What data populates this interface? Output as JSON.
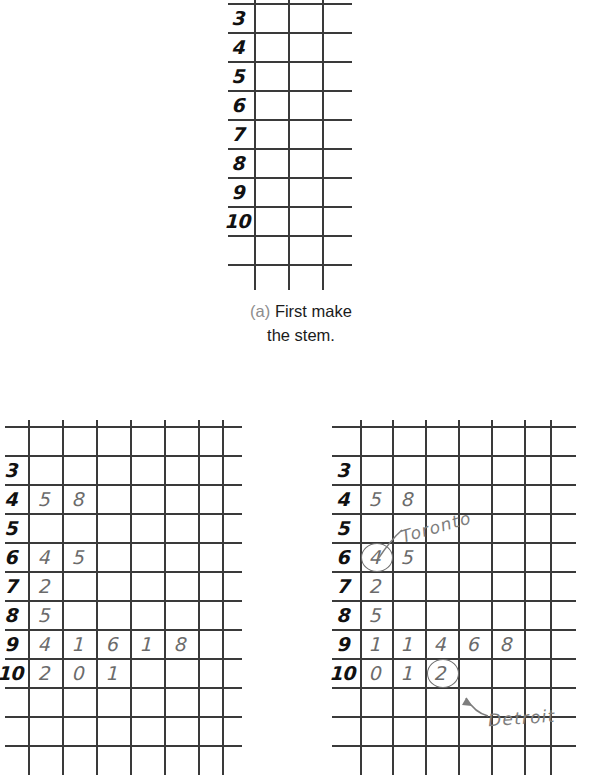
{
  "figure": {
    "title_caption_a": {
      "label": "(a)",
      "line1": "First make",
      "line2": "the stem."
    },
    "colors": {
      "grid_line": "#3a3a3a",
      "stem_digit": "#111111",
      "leaf_digit": "#6b6b6b",
      "annotation": "#7d7d7d",
      "caption_label": "#8d8d8d"
    }
  },
  "panel_a": {
    "name": "stem-only-plot",
    "stems": [
      "3",
      "4",
      "5",
      "6",
      "7",
      "8",
      "9",
      "10"
    ],
    "leaves": [
      [],
      [],
      [],
      [],
      [],
      [],
      [],
      []
    ],
    "columns": 3,
    "rows": 10
  },
  "panel_b": {
    "name": "stem-and-leaf-unordered",
    "rows": [
      {
        "stem": "3",
        "leaves": []
      },
      {
        "stem": "4",
        "leaves": [
          "5",
          "8"
        ]
      },
      {
        "stem": "5",
        "leaves": []
      },
      {
        "stem": "6",
        "leaves": [
          "4",
          "5"
        ]
      },
      {
        "stem": "7",
        "leaves": [
          "2"
        ]
      },
      {
        "stem": "8",
        "leaves": [
          "5"
        ]
      },
      {
        "stem": "9",
        "leaves": [
          "4",
          "1",
          "6",
          "1",
          "8"
        ]
      },
      {
        "stem": "10",
        "leaves": [
          "2",
          "0",
          "1"
        ]
      }
    ],
    "annotations": []
  },
  "panel_c": {
    "name": "stem-and-leaf-ordered-annotated",
    "rows": [
      {
        "stem": "3",
        "leaves": []
      },
      {
        "stem": "4",
        "leaves": [
          "5",
          "8"
        ]
      },
      {
        "stem": "5",
        "leaves": []
      },
      {
        "stem": "6",
        "leaves": [
          "4",
          "5"
        ],
        "circled_index": 0
      },
      {
        "stem": "7",
        "leaves": [
          "2"
        ]
      },
      {
        "stem": "8",
        "leaves": [
          "5"
        ]
      },
      {
        "stem": "9",
        "leaves": [
          "1",
          "1",
          "4",
          "6",
          "8"
        ]
      },
      {
        "stem": "10",
        "leaves": [
          "0",
          "1",
          "2"
        ],
        "circled_index": 2
      }
    ],
    "annotations": [
      {
        "text": "Toronto",
        "target_stem": "6",
        "target_leaf_index": 0
      },
      {
        "text": "Detroit",
        "target_stem": "10",
        "target_leaf_index": 2
      }
    ]
  },
  "chart_data": {
    "type": "table",
    "panels": [
      {
        "caption": "(a) First make the stem.",
        "stems": [
          "3",
          "4",
          "5",
          "6",
          "7",
          "8",
          "9",
          "10"
        ],
        "leaves": [
          [],
          [],
          [],
          [],
          [],
          [],
          [],
          []
        ]
      },
      {
        "caption": "",
        "stems": [
          "3",
          "4",
          "5",
          "6",
          "7",
          "8",
          "9",
          "10"
        ],
        "leaves": [
          [],
          [
            "5",
            "8"
          ],
          [],
          [
            "4",
            "5"
          ],
          [
            "2"
          ],
          [
            "5"
          ],
          [
            "4",
            "1",
            "6",
            "1",
            "8"
          ],
          [
            "2",
            "0",
            "1"
          ]
        ]
      },
      {
        "caption": "",
        "stems": [
          "3",
          "4",
          "5",
          "6",
          "7",
          "8",
          "9",
          "10"
        ],
        "leaves": [
          [],
          [
            "5",
            "8"
          ],
          [],
          [
            "4",
            "5"
          ],
          [
            "2"
          ],
          [
            "5"
          ],
          [
            "1",
            "1",
            "4",
            "6",
            "8"
          ],
          [
            "0",
            "1",
            "2"
          ]
        ],
        "highlights": [
          {
            "label": "Toronto",
            "stem": "6",
            "leaf": "4"
          },
          {
            "label": "Detroit",
            "stem": "10",
            "leaf": "2"
          }
        ]
      }
    ]
  }
}
